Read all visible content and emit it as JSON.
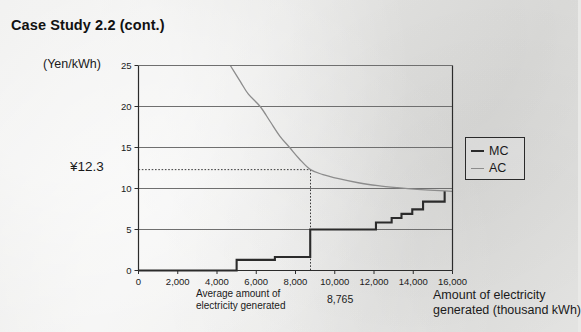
{
  "page": {
    "title": "Case Study 2.2  (cont.)"
  },
  "labels": {
    "y_unit": "(Yen/kWh)",
    "threshold_marker": "¥12.3",
    "x_axis_title_line1": "Amount of electricity",
    "x_axis_title_line2": "generated (thousand kWh)",
    "avg_annotation_line1": "Average amount of",
    "avg_annotation_line2": "electricity generated",
    "avg_value": "8,765"
  },
  "legend": {
    "position": "right",
    "items": [
      {
        "label": "MC",
        "color": "#2b2b2b",
        "width": 2.1
      },
      {
        "label": "AC",
        "color": "#8c8c8c",
        "width": 1.3
      }
    ]
  },
  "colors": {
    "mc_line": "#2b2b2b",
    "ac_line": "#8c8c8c",
    "gridline": "#6f6f6f",
    "axis": "#2b2b2b",
    "dotted_guide": "#3a3a3a",
    "paper": "#e9e9e7"
  },
  "chart_data": {
    "type": "line",
    "title": "Case Study 2.2  (cont.)",
    "xlabel": "Amount of electricity generated (thousand kWh)",
    "ylabel": "(Yen/kWh)",
    "xlim": [
      0,
      16000
    ],
    "ylim": [
      0,
      25
    ],
    "grid": "horizontal",
    "x_ticks": [
      0,
      2000,
      4000,
      6000,
      8000,
      10000,
      12000,
      14000,
      16000
    ],
    "x_tick_labels": [
      "0",
      "2,000",
      "4,000",
      "6,000",
      "8,000",
      "10,000",
      "12,000",
      "14,000",
      "16,000"
    ],
    "y_ticks": [
      0,
      5,
      10,
      15,
      20,
      25
    ],
    "y_tick_labels": [
      "0",
      "5",
      "10",
      "15",
      "20",
      "25"
    ],
    "annotations": [
      {
        "name": "average-output-guide",
        "x": 8765,
        "y": 12.3,
        "label": "8,765",
        "y_label": "¥12.3",
        "style": "dotted-crosshair"
      }
    ],
    "series": [
      {
        "name": "MC",
        "style": "step",
        "color": "#2b2b2b",
        "points": [
          [
            0,
            0.0
          ],
          [
            5000,
            0.0
          ],
          [
            5000,
            1.3
          ],
          [
            6950,
            1.3
          ],
          [
            6950,
            1.65
          ],
          [
            8750,
            1.65
          ],
          [
            8750,
            5.0
          ],
          [
            12100,
            5.0
          ],
          [
            12100,
            5.85
          ],
          [
            12900,
            5.85
          ],
          [
            12900,
            6.4
          ],
          [
            13400,
            6.4
          ],
          [
            13400,
            6.9
          ],
          [
            13950,
            6.9
          ],
          [
            13950,
            7.45
          ],
          [
            14500,
            7.45
          ],
          [
            14500,
            8.4
          ],
          [
            15600,
            8.4
          ],
          [
            15600,
            9.7
          ]
        ]
      },
      {
        "name": "AC",
        "style": "curve",
        "color": "#8c8c8c",
        "points": [
          [
            4680,
            25.0
          ],
          [
            5200,
            23.0
          ],
          [
            5600,
            21.5
          ],
          [
            6200,
            20.0
          ],
          [
            6700,
            18.2
          ],
          [
            7200,
            16.4
          ],
          [
            7700,
            15.0
          ],
          [
            8200,
            13.6
          ],
          [
            8765,
            12.3
          ],
          [
            9400,
            11.7
          ],
          [
            10200,
            11.2
          ],
          [
            11200,
            10.7
          ],
          [
            12200,
            10.35
          ],
          [
            13200,
            10.1
          ],
          [
            14200,
            9.9
          ],
          [
            15600,
            9.7
          ],
          [
            16000,
            9.65
          ]
        ]
      }
    ]
  }
}
